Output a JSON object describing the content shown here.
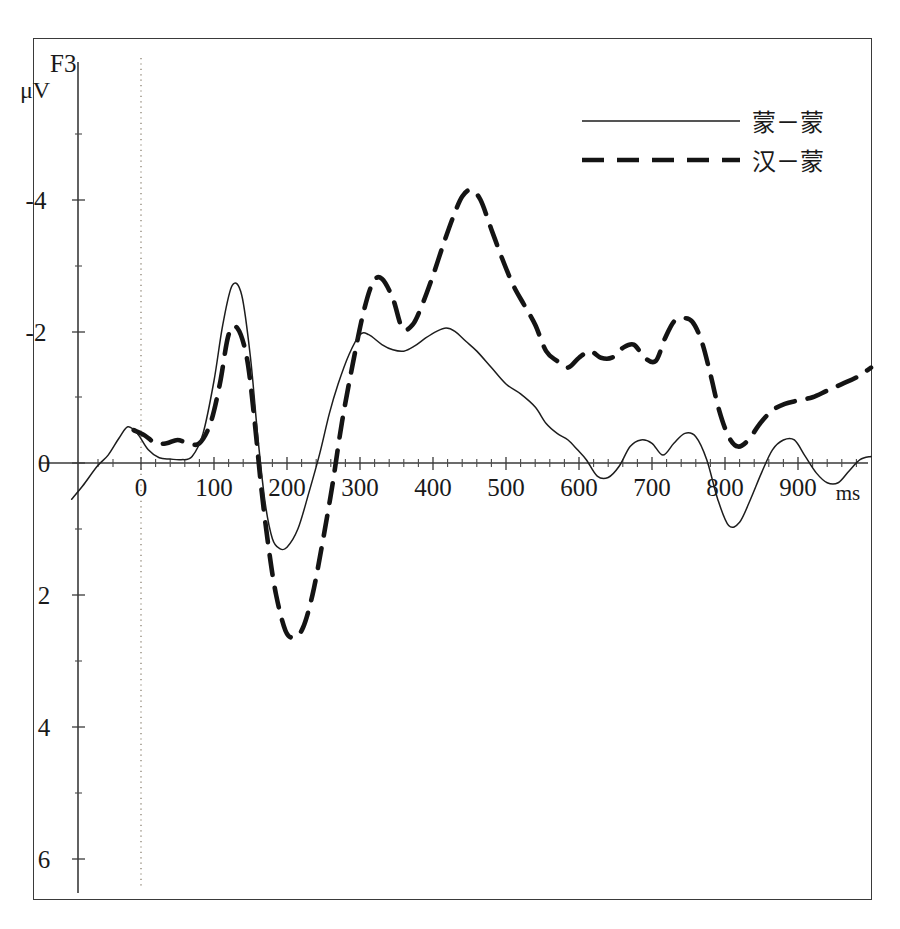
{
  "figure": {
    "channel_label": "F3",
    "unit_label": "μV",
    "time_unit_label": "ms"
  },
  "axes": {
    "y_ticks": [
      "-4",
      "-2",
      "0",
      "2",
      "4",
      "6"
    ],
    "x_ticks": [
      "0",
      "100",
      "200",
      "300",
      "400",
      "500",
      "600",
      "700",
      "800",
      "900"
    ]
  },
  "legend": {
    "entries": [
      {
        "label": "蒙－蒙",
        "style": "solid"
      },
      {
        "label": "汉－蒙",
        "style": "dashed"
      }
    ]
  },
  "chart_data": {
    "type": "line",
    "title": "F3",
    "xlabel": "ms",
    "ylabel": "μV",
    "xlim": [
      -100,
      1010
    ],
    "ylim": [
      -5.2,
      6.6
    ],
    "y_inverted": true,
    "grid": false,
    "legend_position": "top-right",
    "annotations": [
      {
        "text": "F3",
        "role": "channel-name"
      },
      {
        "text": "μV",
        "role": "y-axis-unit"
      },
      {
        "text": "ms",
        "role": "x-axis-unit"
      },
      {
        "text": "stimulus onset marker at 0 ms",
        "role": "vertical-dotted-line"
      }
    ],
    "x_tick_values": [
      0,
      100,
      200,
      300,
      400,
      500,
      600,
      700,
      800,
      900
    ],
    "y_tick_values": [
      -4,
      -2,
      0,
      2,
      4,
      6
    ],
    "series": [
      {
        "name": "蒙－蒙",
        "style": "solid",
        "x": [
          -95,
          -80,
          -60,
          -45,
          -30,
          -18,
          -5,
          10,
          25,
          40,
          55,
          70,
          85,
          100,
          112,
          125,
          138,
          150,
          160,
          170,
          180,
          190,
          200,
          215,
          230,
          245,
          258,
          270,
          285,
          300,
          312,
          330,
          345,
          360,
          375,
          390,
          405,
          418,
          430,
          445,
          460,
          480,
          500,
          520,
          540,
          555,
          570,
          585,
          598,
          610,
          625,
          640,
          655,
          670,
          685,
          700,
          715,
          730,
          745,
          760,
          775,
          790,
          805,
          820,
          835,
          850,
          865,
          880,
          895,
          910,
          925,
          940,
          955,
          970,
          985,
          1000
        ],
        "y": [
          0.55,
          0.35,
          0.05,
          -0.12,
          -0.38,
          -0.55,
          -0.45,
          -0.2,
          -0.08,
          -0.06,
          -0.05,
          -0.1,
          -0.45,
          -1.25,
          -2.1,
          -2.7,
          -2.55,
          -1.6,
          -0.4,
          0.6,
          1.15,
          1.3,
          1.28,
          1.0,
          0.45,
          -0.15,
          -0.75,
          -1.2,
          -1.65,
          -1.95,
          -1.95,
          -1.8,
          -1.72,
          -1.7,
          -1.78,
          -1.9,
          -2.0,
          -2.05,
          -2.0,
          -1.85,
          -1.7,
          -1.45,
          -1.2,
          -1.05,
          -0.85,
          -0.6,
          -0.45,
          -0.35,
          -0.2,
          -0.05,
          0.2,
          0.22,
          0.05,
          -0.25,
          -0.35,
          -0.3,
          -0.12,
          -0.3,
          -0.45,
          -0.4,
          -0.05,
          0.55,
          0.95,
          0.9,
          0.55,
          0.15,
          -0.2,
          -0.35,
          -0.35,
          -0.1,
          0.15,
          0.3,
          0.3,
          0.12,
          -0.05,
          -0.1
        ]
      },
      {
        "name": "汉－蒙",
        "style": "dashed",
        "x": [
          -10,
          5,
          20,
          35,
          50,
          65,
          80,
          95,
          108,
          120,
          132,
          145,
          155,
          165,
          175,
          185,
          198,
          210,
          222,
          235,
          248,
          262,
          275,
          290,
          305,
          318,
          330,
          345,
          358,
          372,
          385,
          400,
          415,
          428,
          440,
          452,
          465,
          480,
          495,
          510,
          525,
          540,
          555,
          570,
          585,
          600,
          615,
          630,
          645,
          660,
          675,
          690,
          705,
          718,
          730,
          742,
          755,
          768,
          780,
          792,
          805,
          818,
          832,
          848,
          865,
          882,
          900,
          920,
          940,
          960,
          980,
          1000
        ],
        "y": [
          -0.5,
          -0.42,
          -0.3,
          -0.3,
          -0.35,
          -0.3,
          -0.3,
          -0.6,
          -1.2,
          -1.95,
          -2.05,
          -1.6,
          -0.7,
          0.4,
          1.3,
          2.0,
          2.55,
          2.65,
          2.5,
          2.0,
          1.25,
          0.35,
          -0.6,
          -1.5,
          -2.3,
          -2.75,
          -2.8,
          -2.5,
          -2.05,
          -2.1,
          -2.4,
          -2.85,
          -3.35,
          -3.75,
          -4.05,
          -4.15,
          -4.0,
          -3.55,
          -3.1,
          -2.7,
          -2.4,
          -2.1,
          -1.7,
          -1.55,
          -1.45,
          -1.6,
          -1.7,
          -1.6,
          -1.6,
          -1.75,
          -1.8,
          -1.6,
          -1.55,
          -1.9,
          -2.15,
          -2.2,
          -2.15,
          -1.85,
          -1.35,
          -0.8,
          -0.4,
          -0.25,
          -0.35,
          -0.6,
          -0.8,
          -0.9,
          -0.95,
          -1.0,
          -1.1,
          -1.2,
          -1.3,
          -1.45
        ]
      }
    ]
  }
}
